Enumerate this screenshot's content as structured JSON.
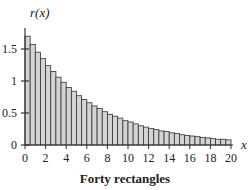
{
  "chart_data": {
    "type": "bar",
    "title": "Forty rectangles",
    "xlabel": "x",
    "ylabel": "r(x)",
    "xlim": [
      0,
      20
    ],
    "ylim": [
      0,
      1.75
    ],
    "x_ticks": [
      0,
      2,
      4,
      6,
      8,
      10,
      12,
      14,
      16,
      18,
      20
    ],
    "y_ticks": [
      0,
      0.5,
      1,
      1.5
    ],
    "y_tick_labels": [
      "0",
      "0.5",
      "1",
      "1.5"
    ],
    "bar_width": 0.5,
    "bar_count": 40,
    "grid": false,
    "legend": null,
    "bar_color": "#d4d4d4",
    "edge_color": "#333333",
    "x": [
      0,
      0.5,
      1,
      1.5,
      2,
      2.5,
      3,
      3.5,
      4,
      4.5,
      5,
      5.5,
      6,
      6.5,
      7,
      7.5,
      8,
      8.5,
      9,
      9.5,
      10,
      10.5,
      11,
      11.5,
      12,
      12.5,
      13,
      13.5,
      14,
      14.5,
      15,
      15.5,
      16,
      16.5,
      17,
      17.5,
      18,
      18.5,
      19,
      19.5
    ],
    "values": [
      1.7,
      1.57,
      1.45,
      1.35,
      1.24,
      1.15,
      1.06,
      0.98,
      0.9,
      0.84,
      0.77,
      0.71,
      0.66,
      0.61,
      0.57,
      0.52,
      0.48,
      0.45,
      0.42,
      0.38,
      0.36,
      0.33,
      0.3,
      0.28,
      0.26,
      0.24,
      0.22,
      0.21,
      0.19,
      0.18,
      0.16,
      0.15,
      0.14,
      0.13,
      0.12,
      0.11,
      0.1,
      0.09,
      0.09,
      0.08
    ]
  },
  "caption": "Forty rectangles"
}
